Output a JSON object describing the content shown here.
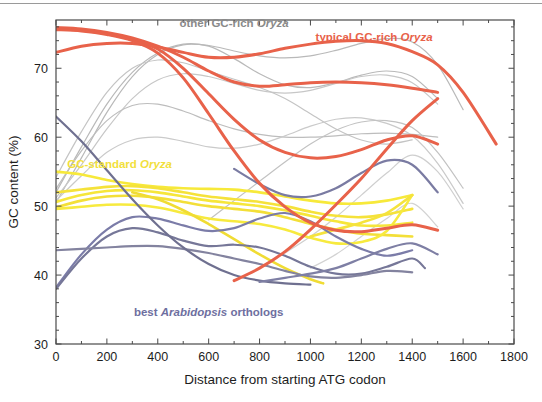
{
  "figure": {
    "background_color": "#ffffff",
    "frame_color": "#4a4a4a",
    "top_rule_color": "#9a9a9a"
  },
  "chart_data": {
    "type": "line",
    "title": "",
    "xlabel": "Distance from starting ATG codon",
    "ylabel": "GC content (%)",
    "xlim": [
      0,
      1800
    ],
    "ylim": [
      30,
      77
    ],
    "xticks": [
      0,
      200,
      400,
      600,
      800,
      1000,
      1200,
      1400,
      1600,
      1800
    ],
    "xtick_labels": [
      "0",
      "200",
      "400",
      "600",
      "800",
      "1000",
      "1200",
      "1400",
      "1600",
      "1800"
    ],
    "yticks": [
      30,
      40,
      50,
      60,
      70
    ],
    "ytick_labels": [
      "30",
      "40",
      "50",
      "60",
      "70"
    ],
    "minor_xtick_step": 100,
    "minor_ytick_step": 2,
    "grid": false,
    "legend_position": "inline-annotations",
    "annotations": [
      {
        "id": "other-gc-rich-oryza",
        "text_plain": "other GC-rich Oryza",
        "text_normal": "other GC-rich ",
        "text_italic": "Oryza",
        "color": "#8a8a8a",
        "x_data": 700,
        "y_data": 76.0
      },
      {
        "id": "typical-gc-rich-oryza",
        "text_plain": "typical GC-rich Oryza",
        "text_normal": "typical GC-rich ",
        "text_italic": "Oryza",
        "color": "#e8624a",
        "x_data": 1250,
        "y_data": 74.0
      },
      {
        "id": "gc-standard-oryza",
        "text_plain": "GC-standard Oryza",
        "text_normal": "GC-standard ",
        "text_italic": "Oryza",
        "color": "#f2e03c",
        "x_data": 250,
        "y_data": 55.5
      },
      {
        "id": "best-arabidopsis-orthologs",
        "text_plain": "best Arabidopsis orthologs",
        "text_normal_pre": "best ",
        "text_italic": "Arabidopsis",
        "text_normal_post": " orthologs",
        "color": "#6e6fa0",
        "x_data": 600,
        "y_data": 34.0
      }
    ],
    "series": [
      {
        "name": "typical GC-rich Oryza 1",
        "group": "typical-gc-rich-oryza",
        "color": "#e8624a",
        "width": 3.0,
        "x": [
          0,
          100,
          200,
          300,
          400,
          500,
          600,
          700,
          800,
          900,
          1000,
          1100,
          1200,
          1300,
          1400,
          1500,
          1600,
          1730
        ],
        "y": [
          72.3,
          73.2,
          73.6,
          73.6,
          73.1,
          72.3,
          71.6,
          71.6,
          72.1,
          72.9,
          73.5,
          73.9,
          74.0,
          73.6,
          72.4,
          70.5,
          66.5,
          59.0
        ]
      },
      {
        "name": "typical GC-rich Oryza 2",
        "group": "typical-gc-rich-oryza",
        "color": "#e8624a",
        "width": 3.0,
        "x": [
          0,
          100,
          200,
          300,
          400,
          500,
          600,
          700,
          800,
          900,
          1000,
          1100,
          1200,
          1300,
          1400,
          1500
        ],
        "y": [
          75.9,
          75.7,
          75.2,
          74.4,
          73.2,
          71.6,
          69.6,
          68.0,
          67.4,
          67.6,
          67.9,
          68.0,
          67.9,
          67.6,
          67.1,
          66.5
        ]
      },
      {
        "name": "typical GC-rich Oryza 3",
        "group": "typical-gc-rich-oryza",
        "color": "#e8624a",
        "width": 3.0,
        "x": [
          0,
          100,
          200,
          300,
          400,
          500,
          600,
          700,
          800,
          900,
          1000,
          1100,
          1200,
          1300,
          1400,
          1500
        ],
        "y": [
          75.8,
          75.5,
          75.0,
          74.2,
          72.8,
          70.0,
          66.3,
          62.6,
          59.6,
          57.8,
          57.0,
          57.2,
          58.2,
          59.6,
          60.2,
          59.0
        ]
      },
      {
        "name": "typical GC-rich Oryza 4",
        "group": "typical-gc-rich-oryza",
        "color": "#e8624a",
        "width": 3.0,
        "x": [
          0,
          100,
          200,
          300,
          400,
          500,
          600,
          700,
          800,
          900,
          1000,
          1100,
          1200,
          1300,
          1400,
          1500
        ],
        "y": [
          75.6,
          75.4,
          74.9,
          74.0,
          72.2,
          68.6,
          63.4,
          58.0,
          53.3,
          49.9,
          47.6,
          46.5,
          46.3,
          46.8,
          47.3,
          46.5
        ]
      },
      {
        "name": "typical GC-rich Oryza 5",
        "group": "typical-gc-rich-oryza",
        "color": "#e8624a",
        "width": 3.0,
        "x": [
          700,
          800,
          900,
          1000,
          1100,
          1200,
          1300,
          1400,
          1500
        ],
        "y": [
          39.2,
          41.0,
          43.4,
          46.6,
          50.2,
          54.0,
          58.3,
          62.4,
          65.6
        ]
      },
      {
        "name": "other GC-rich Oryza a",
        "group": "other-gc-rich-oryza",
        "color": "#b9b9b9",
        "width": 1.2,
        "x": [
          0,
          100,
          200,
          300,
          400,
          500,
          600,
          700,
          800,
          900,
          1000,
          1100,
          1200,
          1300,
          1400,
          1500,
          1600
        ],
        "y": [
          50.5,
          57.0,
          63.6,
          68.8,
          72.0,
          73.4,
          73.3,
          72.5,
          71.8,
          71.5,
          71.8,
          72.6,
          73.6,
          74.3,
          73.8,
          70.5,
          64.0
        ]
      },
      {
        "name": "other GC-rich Oryza b",
        "group": "other-gc-rich-oryza",
        "color": "#b9b9b9",
        "width": 1.2,
        "x": [
          0,
          100,
          200,
          300,
          400,
          500,
          600,
          700,
          800,
          900,
          1000,
          1100,
          1200,
          1300,
          1400,
          1500
        ],
        "y": [
          52.0,
          58.6,
          64.8,
          69.4,
          72.2,
          73.5,
          73.2,
          71.4,
          69.2,
          67.6,
          67.2,
          67.9,
          69.0,
          69.6,
          68.8,
          65.6
        ]
      },
      {
        "name": "other GC-rich Oryza c",
        "group": "other-gc-rich-oryza",
        "color": "#c7c7c7",
        "width": 1.2,
        "x": [
          0,
          100,
          200,
          300,
          400,
          500,
          600,
          700,
          800,
          900,
          1000,
          1100,
          1200,
          1300,
          1400,
          1500
        ],
        "y": [
          51.2,
          56.0,
          61.2,
          65.6,
          68.3,
          69.2,
          68.8,
          67.8,
          66.8,
          66.4,
          66.8,
          67.8,
          68.8,
          69.0,
          67.9,
          64.8
        ]
      },
      {
        "name": "other GC-rich Oryza d",
        "group": "other-gc-rich-oryza",
        "color": "#c4c4c4",
        "width": 1.2,
        "x": [
          0,
          100,
          200,
          300,
          400,
          500,
          600,
          700,
          800,
          900,
          1000,
          1100,
          1200,
          1300,
          1400
        ],
        "y": [
          54.2,
          60.8,
          66.5,
          70.0,
          71.2,
          70.8,
          69.6,
          68.4,
          67.2,
          65.6,
          63.4,
          61.2,
          59.6,
          59.0,
          59.6
        ]
      },
      {
        "name": "other GC-rich Oryza e",
        "group": "other-gc-rich-oryza",
        "color": "#bdbdbd",
        "width": 1.2,
        "x": [
          0,
          100,
          200,
          300,
          400,
          500,
          600,
          700,
          800,
          900,
          1000,
          1100,
          1200,
          1300,
          1400,
          1500
        ],
        "y": [
          52.5,
          58.0,
          62.4,
          64.6,
          64.8,
          63.8,
          62.4,
          61.2,
          60.4,
          60.0,
          60.0,
          60.2,
          60.5,
          60.6,
          60.4,
          60.0
        ]
      },
      {
        "name": "other GC-rich Oryza f",
        "group": "other-gc-rich-oryza",
        "color": "#cacaca",
        "width": 1.2,
        "x": [
          0,
          100,
          200,
          300,
          400,
          500,
          600,
          700,
          800,
          900,
          1000,
          1100,
          1200,
          1300,
          1400,
          1500,
          1600
        ],
        "y": [
          50.8,
          54.4,
          57.8,
          59.6,
          60.0,
          59.4,
          58.6,
          58.4,
          59.0,
          60.2,
          61.6,
          62.6,
          62.8,
          62.0,
          60.2,
          56.2,
          50.4
        ]
      },
      {
        "name": "other GC-rich Oryza g",
        "group": "other-gc-rich-oryza",
        "color": "#c2c2c2",
        "width": 1.2,
        "x": [
          600,
          700,
          800,
          900,
          1000,
          1100,
          1200,
          1300,
          1400,
          1500,
          1600
        ],
        "y": [
          48.0,
          50.8,
          53.6,
          56.4,
          59.0,
          61.0,
          62.2,
          62.4,
          61.4,
          57.8,
          52.6
        ]
      },
      {
        "name": "other GC-rich Oryza h",
        "group": "other-gc-rich-oryza",
        "color": "#cfcfcf",
        "width": 1.2,
        "x": [
          900,
          1000,
          1100,
          1200,
          1300,
          1400,
          1500,
          1600
        ],
        "y": [
          43.2,
          45.6,
          48.4,
          51.6,
          54.8,
          57.4,
          55.0,
          49.6
        ]
      },
      {
        "name": "other GC-rich Oryza i",
        "group": "other-gc-rich-oryza",
        "color": "#d2d2d2",
        "width": 1.2,
        "x": [
          1000,
          1100,
          1200,
          1300,
          1400,
          1500
        ],
        "y": [
          41.0,
          43.0,
          45.6,
          48.2,
          50.4,
          47.0
        ]
      },
      {
        "name": "GC-standard Oryza 1",
        "group": "gc-standard-oryza",
        "color": "#f7e93a",
        "width": 2.6,
        "x": [
          0,
          100,
          200,
          300,
          400,
          500,
          600,
          700,
          800,
          900,
          1000,
          1100,
          1200,
          1300,
          1400
        ],
        "y": [
          55.0,
          54.6,
          53.8,
          53.2,
          52.8,
          52.6,
          52.5,
          52.4,
          52.0,
          51.4,
          50.8,
          50.4,
          50.4,
          50.8,
          51.6
        ]
      },
      {
        "name": "GC-standard Oryza 2",
        "group": "gc-standard-oryza",
        "color": "#f5e23a",
        "width": 2.6,
        "x": [
          0,
          100,
          200,
          300,
          400,
          500,
          600,
          700,
          800,
          900,
          1000,
          1100,
          1200,
          1300,
          1400
        ],
        "y": [
          52.0,
          52.4,
          52.8,
          52.9,
          52.6,
          52.0,
          51.4,
          51.0,
          50.6,
          50.0,
          49.2,
          48.6,
          48.4,
          48.8,
          49.6
        ]
      },
      {
        "name": "GC-standard Oryza 3",
        "group": "gc-standard-oryza",
        "color": "#f6e63a",
        "width": 2.6,
        "x": [
          0,
          100,
          200,
          300,
          400,
          500,
          600,
          700,
          800,
          900,
          1000,
          1100,
          1200,
          1300,
          1400
        ],
        "y": [
          50.6,
          51.6,
          52.2,
          52.3,
          52.0,
          51.4,
          50.8,
          50.4,
          50.0,
          49.4,
          48.6,
          47.8,
          47.2,
          47.2,
          47.6
        ]
      },
      {
        "name": "GC-standard Oryza 4",
        "group": "gc-standard-oryza",
        "color": "#f3df38",
        "width": 2.6,
        "x": [
          0,
          100,
          200,
          300,
          400,
          500,
          600,
          700,
          800,
          900,
          1000,
          1100,
          1200,
          1300,
          1400
        ],
        "y": [
          49.8,
          50.8,
          51.4,
          51.5,
          51.2,
          50.6,
          50.0,
          49.6,
          49.2,
          48.4,
          47.4,
          46.6,
          46.0,
          45.8,
          45.6
        ]
      },
      {
        "name": "GC-standard Oryza 5",
        "group": "gc-standard-oryza",
        "color": "#f7ea3e",
        "width": 2.6,
        "x": [
          0,
          100,
          200,
          300,
          400,
          500,
          600,
          700,
          800,
          900,
          1000,
          1100,
          1200,
          1300,
          1400
        ],
        "y": [
          49.6,
          49.9,
          50.2,
          50.2,
          49.8,
          49.0,
          48.2,
          47.8,
          47.4,
          46.6,
          45.4,
          44.6,
          44.8,
          46.4,
          51.6
        ]
      },
      {
        "name": "GC-standard Oryza 6 (descending)",
        "group": "gc-standard-oryza",
        "color": "#f0dc34",
        "width": 2.6,
        "x": [
          300,
          400,
          500,
          600,
          700,
          800,
          900,
          1000,
          1050
        ],
        "y": [
          52.0,
          51.0,
          49.4,
          47.4,
          45.2,
          43.0,
          41.0,
          39.4,
          38.8
        ]
      },
      {
        "name": "GC-standard Oryza 7 (rising)",
        "group": "gc-standard-oryza",
        "color": "#f5e33c",
        "width": 2.6,
        "x": [
          1000,
          1100,
          1200,
          1300,
          1400
        ],
        "y": [
          45.6,
          46.6,
          47.6,
          49.0,
          51.6
        ]
      },
      {
        "name": "best Arabidopsis ortholog 1",
        "group": "best-arabidopsis-orthologs",
        "color": "#7b7ca8",
        "width": 2.2,
        "x": [
          0,
          100,
          200,
          300,
          400,
          500,
          600,
          700,
          800,
          900,
          1000,
          1100,
          1200,
          1300,
          1400
        ],
        "y": [
          38.2,
          43.0,
          46.6,
          48.4,
          48.2,
          47.2,
          46.4,
          46.8,
          48.2,
          49.0,
          47.8,
          45.6,
          43.8,
          42.8,
          43.6
        ]
      },
      {
        "name": "best Arabidopsis ortholog 2",
        "group": "best-arabidopsis-orthologs",
        "color": "#767798",
        "width": 2.2,
        "x": [
          0,
          100,
          200,
          300,
          400,
          500,
          600,
          700,
          800,
          900,
          1000,
          1100,
          1200,
          1300,
          1400,
          1450
        ],
        "y": [
          38.0,
          42.4,
          45.6,
          46.8,
          46.2,
          45.0,
          44.2,
          44.4,
          44.0,
          42.8,
          41.2,
          40.2,
          40.2,
          41.2,
          42.4,
          41.0
        ]
      },
      {
        "name": "best Arabidopsis ortholog 3",
        "group": "best-arabidopsis-orthologs",
        "color": "#83839f",
        "width": 2.2,
        "x": [
          0,
          100,
          200,
          300,
          400,
          500,
          600,
          700,
          800,
          900,
          1000,
          1100,
          1200,
          1300,
          1400
        ],
        "y": [
          43.6,
          43.8,
          44.0,
          44.2,
          44.2,
          43.8,
          43.2,
          42.4,
          41.6,
          40.6,
          39.8,
          39.6,
          40.0,
          40.6,
          40.4
        ]
      },
      {
        "name": "best Arabidopsis ortholog 4 (descending steep)",
        "group": "best-arabidopsis-orthologs",
        "color": "#6f7090",
        "width": 2.2,
        "x": [
          0,
          100,
          200,
          300,
          400,
          500,
          600,
          700,
          800,
          900,
          1000
        ],
        "y": [
          63.0,
          59.4,
          55.2,
          51.0,
          47.2,
          44.0,
          41.6,
          40.0,
          39.2,
          38.8,
          38.6
        ]
      },
      {
        "name": "best Arabidopsis ortholog 5 (rising right)",
        "group": "best-arabidopsis-orthologs",
        "color": "#7a7ba2",
        "width": 2.2,
        "x": [
          700,
          800,
          900,
          1000,
          1100,
          1200,
          1300,
          1400,
          1500
        ],
        "y": [
          55.4,
          53.2,
          51.6,
          51.4,
          52.6,
          54.8,
          56.6,
          56.0,
          52.0
        ]
      },
      {
        "name": "best Arabidopsis ortholog 6 (low flat)",
        "group": "best-arabidopsis-orthologs",
        "color": "#7e7fa4",
        "width": 2.2,
        "x": [
          800,
          900,
          1000,
          1100,
          1200,
          1300,
          1400,
          1500
        ],
        "y": [
          39.0,
          39.6,
          40.2,
          41.0,
          42.4,
          43.8,
          44.6,
          43.0
        ]
      }
    ]
  }
}
